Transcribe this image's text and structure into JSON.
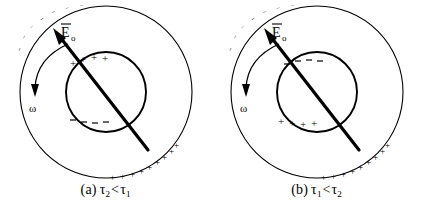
{
  "figure": {
    "background_color": "#ffffff",
    "ink_color": "#000000",
    "panels": [
      {
        "id": "a",
        "caption_label": "(a)",
        "caption_left_symbol": "τ",
        "caption_left_subscript": "2",
        "caption_relation": "<",
        "caption_right_symbol": "τ",
        "caption_right_subscript": "1",
        "caption_plain": "(a) τ₂ < τ₁",
        "field_label_symbol": "E",
        "field_label_subscript": "o",
        "field_label_plain": "Ēo",
        "omega_label": "ω",
        "outer_circle": {
          "center_x": 106,
          "center_y": 92,
          "radius": 86,
          "upper_left_charge": "−",
          "upper_left_count": 7,
          "lower_right_charge": "+",
          "lower_right_count": 9
        },
        "inner_circle": {
          "center_x": 106,
          "center_y": 92,
          "radius": 40,
          "top_charge": "+",
          "top_count": 4,
          "bottom_charge": "−",
          "bottom_count": 4
        },
        "field_arrow": {
          "tail_x": 148,
          "tail_y": 150,
          "head_x": 55,
          "head_y": 31
        },
        "omega_arrow": {
          "direction": "counterclockwise",
          "head_x": 35,
          "head_y": 94
        }
      },
      {
        "id": "b",
        "caption_label": "(b)",
        "caption_left_symbol": "τ",
        "caption_left_subscript": "1",
        "caption_relation": "<",
        "caption_right_symbol": "τ",
        "caption_right_subscript": "2",
        "caption_plain": "(b) τ₁ < τ₂",
        "field_label_symbol": "E",
        "field_label_subscript": "o",
        "field_label_plain": "Ēo",
        "omega_label": "ω",
        "outer_circle": {
          "center_x": 106,
          "center_y": 92,
          "radius": 86,
          "upper_left_charge": "−",
          "upper_left_count": 7,
          "lower_right_charge": "+",
          "lower_right_count": 9
        },
        "inner_circle": {
          "center_x": 106,
          "center_y": 92,
          "radius": 40,
          "top_charge": "−",
          "top_count": 4,
          "bottom_charge": "+",
          "bottom_count": 4
        },
        "field_arrow": {
          "tail_x": 148,
          "tail_y": 150,
          "head_x": 55,
          "head_y": 31
        },
        "omega_arrow": {
          "direction": "counterclockwise",
          "head_x": 35,
          "head_y": 94
        }
      }
    ]
  }
}
